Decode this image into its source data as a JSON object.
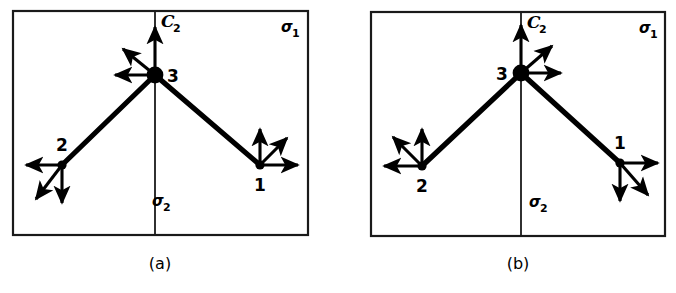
{
  "figure": {
    "type": "molecular-vibration-diagram",
    "panels": [
      {
        "id": "a",
        "caption": "(a)",
        "labels": {
          "c2_axis": "C",
          "c2_axis_sub": "2",
          "sigma1": "σ",
          "sigma1_sub": "1",
          "sigma2": "σ",
          "sigma2_sub": "2"
        },
        "atoms": [
          {
            "label": "1",
            "x": 260,
            "y": 165,
            "r": 4.6,
            "label_dx": 0,
            "label_dy": 26,
            "anchor": "middle"
          },
          {
            "label": "2",
            "x": 62,
            "y": 165,
            "r": 4.6,
            "label_dx": 0,
            "label_dy": -14,
            "anchor": "middle"
          },
          {
            "label": "3",
            "x": 155,
            "y": 75,
            "r": 8.4,
            "label_dx": 18,
            "label_dy": 7,
            "anchor": "middle"
          }
        ],
        "bonds": [
          {
            "from": 2,
            "to": 1
          },
          {
            "from": 2,
            "to": 0
          }
        ],
        "vectors": [
          {
            "atom": 2,
            "dir": "up",
            "dx": 0,
            "dy": -48,
            "name": "atom3-vector-up"
          },
          {
            "atom": 2,
            "dir": "up-left",
            "dx": -32,
            "dy": -26,
            "name": "atom3-vector-upleft"
          },
          {
            "atom": 2,
            "dir": "left",
            "dx": -40,
            "dy": 0,
            "name": "atom3-vector-left"
          },
          {
            "atom": 1,
            "dir": "left",
            "dx": -36,
            "dy": 0,
            "name": "atom2-vector-left"
          },
          {
            "atom": 1,
            "dir": "down",
            "dx": 0,
            "dy": 38,
            "name": "atom2-vector-down"
          },
          {
            "atom": 1,
            "dir": "down-left",
            "dx": -26,
            "dy": 34,
            "name": "atom2-vector-downleft"
          },
          {
            "atom": 0,
            "dir": "up",
            "dx": 0,
            "dy": -36,
            "name": "atom1-vector-up"
          },
          {
            "atom": 0,
            "dir": "up-right",
            "dx": 27,
            "dy": -27,
            "name": "atom1-vector-upright"
          },
          {
            "atom": 0,
            "dir": "right",
            "dx": 38,
            "dy": 0,
            "name": "atom1-vector-right"
          }
        ]
      },
      {
        "id": "b",
        "caption": "(b)",
        "labels": {
          "c2_axis": "C",
          "c2_axis_sub": "2",
          "sigma1": "σ",
          "sigma1_sub": "1",
          "sigma2": "σ",
          "sigma2_sub": "2"
        },
        "atoms": [
          {
            "label": "1",
            "x": 620,
            "y": 163,
            "r": 4.6,
            "label_dx": 0,
            "label_dy": -14,
            "anchor": "middle"
          },
          {
            "label": "2",
            "x": 422,
            "y": 166,
            "r": 4.6,
            "label_dx": 0,
            "label_dy": 26,
            "anchor": "middle"
          },
          {
            "label": "3",
            "x": 521,
            "y": 73,
            "r": 8.4,
            "label_dx": -19,
            "label_dy": 7,
            "anchor": "middle"
          }
        ],
        "bonds": [
          {
            "from": 2,
            "to": 1
          },
          {
            "from": 2,
            "to": 0
          }
        ],
        "vectors": [
          {
            "atom": 2,
            "dir": "up",
            "dx": 0,
            "dy": -48,
            "name": "atom3-vector-up"
          },
          {
            "atom": 2,
            "dir": "up-right",
            "dx": 31,
            "dy": -27,
            "name": "atom3-vector-upright"
          },
          {
            "atom": 2,
            "dir": "right",
            "dx": 40,
            "dy": 0,
            "name": "atom3-vector-right"
          },
          {
            "atom": 1,
            "dir": "up",
            "dx": 0,
            "dy": -37,
            "name": "atom2-vector-up"
          },
          {
            "atom": 1,
            "dir": "up-left",
            "dx": -29,
            "dy": -29,
            "name": "atom2-vector-upleft"
          },
          {
            "atom": 1,
            "dir": "left",
            "dx": -38,
            "dy": 0,
            "name": "atom2-vector-left"
          },
          {
            "atom": 0,
            "dir": "right",
            "dx": 38,
            "dy": 0,
            "name": "atom1-vector-right"
          },
          {
            "atom": 0,
            "dir": "down",
            "dx": 0,
            "dy": 38,
            "name": "atom1-vector-down"
          },
          {
            "atom": 0,
            "dir": "down-right",
            "dx": 28,
            "dy": 32,
            "name": "atom1-vector-downright"
          }
        ]
      }
    ],
    "colors": {
      "ink": "#000000",
      "border": "#1a1a1a",
      "background": "#ffffff"
    }
  }
}
